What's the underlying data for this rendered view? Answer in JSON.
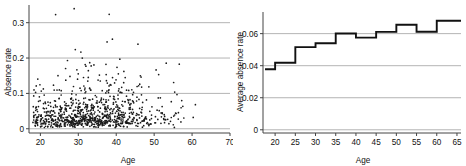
{
  "figure": {
    "panels": [
      {
        "id": "scatter-absence-vs-age",
        "ylabel": "Absence rate",
        "xlabel": "Age"
      },
      {
        "id": "step-average-absence-vs-age",
        "ylabel": "Average absence rate",
        "xlabel": "Age"
      }
    ]
  },
  "chart_data": [
    {
      "type": "scatter",
      "title": "",
      "xlabel": "Age",
      "ylabel": "Absence rate",
      "xlim": [
        17,
        70
      ],
      "ylim": [
        -0.012,
        0.35
      ],
      "xticks": [
        20,
        30,
        40,
        50,
        60,
        70
      ],
      "xticklabels": [
        "20",
        "30",
        "40",
        "50",
        "60",
        "70"
      ],
      "yticks": [
        0,
        0.1,
        0.2,
        0.3
      ],
      "yticklabels": [
        "0",
        "0.1",
        "0.2",
        "0.3"
      ],
      "grid": "horizontal",
      "legend": "none",
      "marker": "dot",
      "n_points": 900,
      "description": "Dense cloud of individual absence rates by age; heaviest mass between ages 18 and 60 at rates below 0.10, thinning sharply above 0.20, with scattered outliers up to 0.34.",
      "density_model": {
        "x_range": [
          18,
          65
        ],
        "x_mode": 33,
        "y_distribution": "right-skewed",
        "y_scale_base": 0.04,
        "y_scale_slope_per_year": 0.0003,
        "y_max_clip": 0.345
      },
      "points": []
    },
    {
      "type": "line",
      "subtype": "step",
      "title": "",
      "xlabel": "Age",
      "ylabel": "Average absence rate",
      "xlim": [
        17,
        66
      ],
      "ylim": [
        -0.002,
        0.0735
      ],
      "xticks": [
        20,
        25,
        30,
        35,
        40,
        45,
        50,
        55,
        60,
        65
      ],
      "xticklabels": [
        "20",
        "25",
        "30",
        "35",
        "40",
        "45",
        "50",
        "55",
        "60",
        "65"
      ],
      "yticks": [
        0,
        0.02,
        0.04,
        0.06
      ],
      "yticklabels": [
        "0",
        "0.02",
        "0.04",
        "0.06"
      ],
      "grid": "horizontal",
      "legend": "none",
      "step_edges": [
        17.5,
        20,
        22.5,
        25,
        27.5,
        30,
        32.5,
        35,
        37.5,
        40,
        42.5,
        45,
        47.5,
        50,
        52.5,
        55,
        57.5,
        60,
        62.5,
        66
      ],
      "values": [
        0.0378,
        0.0378,
        0.0418,
        0.0418,
        0.0516,
        0.0516,
        0.054,
        0.054,
        0.0601,
        0.0601,
        0.0575,
        0.0575,
        0.0575,
        0.0611,
        0.0611,
        0.0655,
        0.0655,
        0.0612,
        0.0612,
        0.068
      ],
      "steps": [
        {
          "x_start": 17.5,
          "x_end": 20.0,
          "value": 0.0378
        },
        {
          "x_start": 20.0,
          "x_end": 25.0,
          "value": 0.0418
        },
        {
          "x_start": 25.0,
          "x_end": 30.0,
          "value": 0.0516
        },
        {
          "x_start": 30.0,
          "x_end": 35.0,
          "value": 0.054
        },
        {
          "x_start": 35.0,
          "x_end": 40.0,
          "value": 0.0601
        },
        {
          "x_start": 40.0,
          "x_end": 45.0,
          "value": 0.0575
        },
        {
          "x_start": 45.0,
          "x_end": 50.0,
          "value": 0.0611
        },
        {
          "x_start": 50.0,
          "x_end": 55.0,
          "value": 0.0655
        },
        {
          "x_start": 55.0,
          "x_end": 60.0,
          "value": 0.0612
        },
        {
          "x_start": 60.0,
          "x_end": 66.0,
          "value": 0.068
        }
      ]
    }
  ]
}
